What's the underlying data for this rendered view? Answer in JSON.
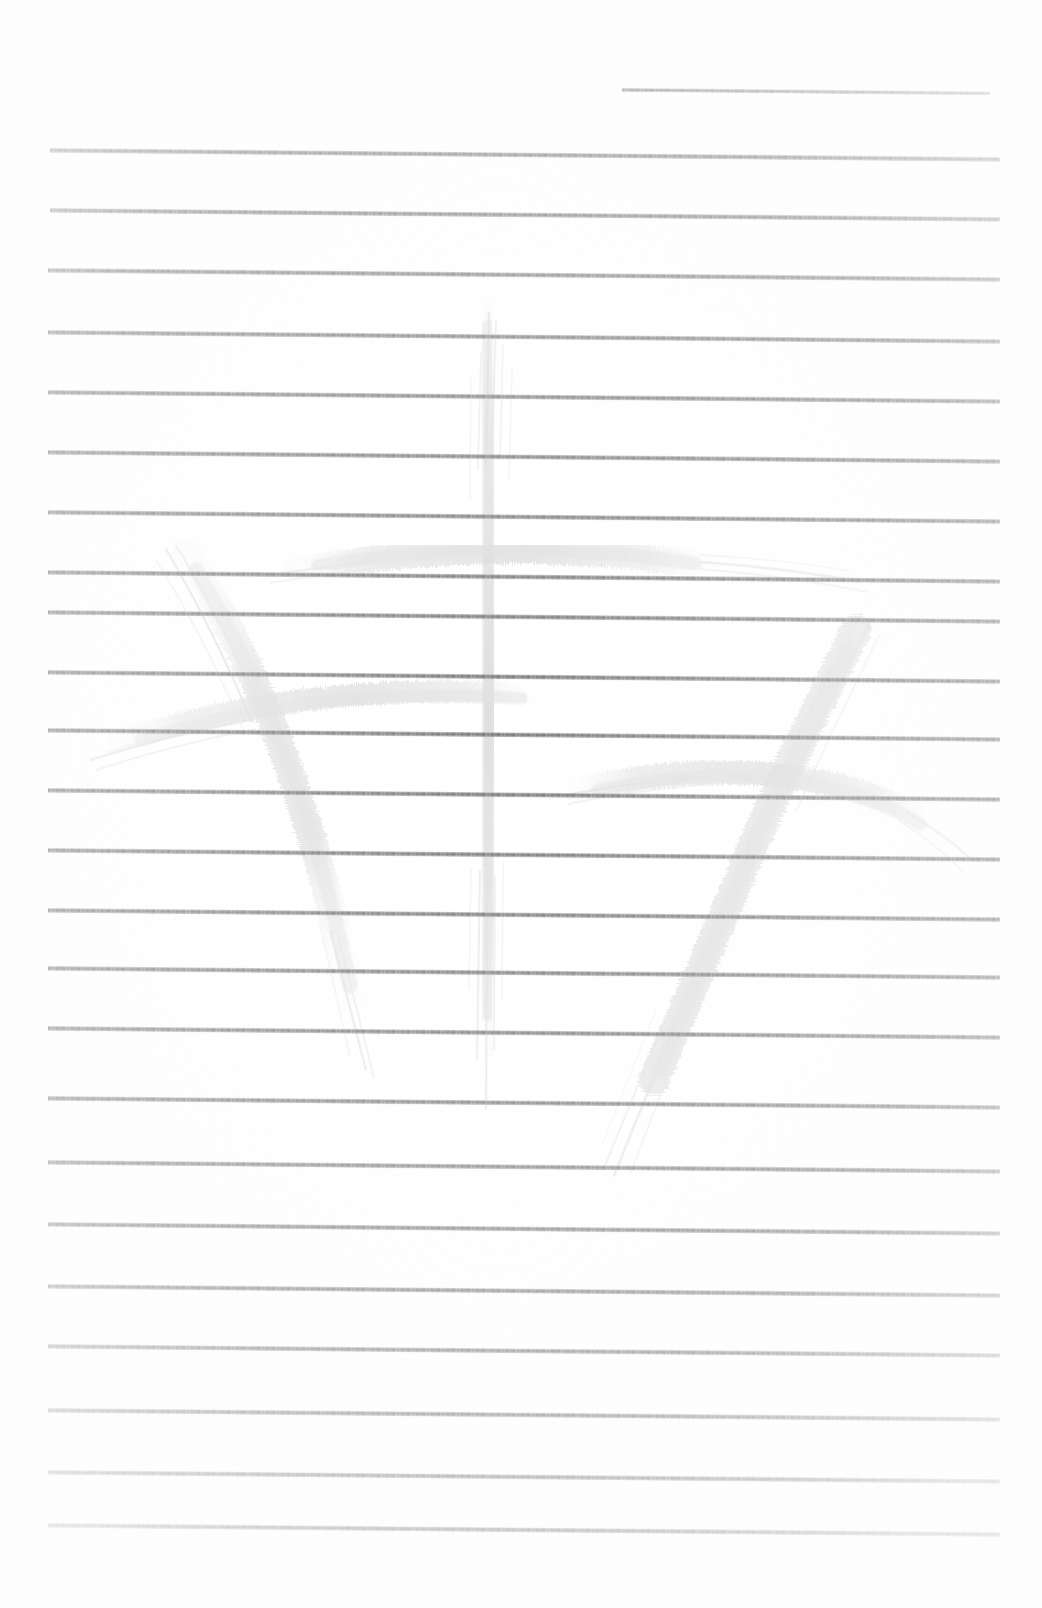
{
  "document": {
    "kind": "scanned-lined-paper",
    "title": "Lined notebook page",
    "page_width": 1042,
    "page_height": 1608,
    "background_color": "#ffffff",
    "rule_color": "#6e6e72",
    "rule_thickness": 5,
    "rule_count": 24,
    "rule_left_x": 50,
    "rule_right_x": 1000,
    "rule_slope_deg": 0.55
  },
  "rules": [
    {
      "index": 1,
      "y": 88,
      "x_start": 622,
      "x_end": 990,
      "thickness": 4,
      "opacity": 0.88,
      "note": "short top rule, right aligned"
    },
    {
      "index": 2,
      "y": 148,
      "x_start": 50,
      "x_end": 1000,
      "thickness": 5,
      "opacity": 0.95
    },
    {
      "index": 3,
      "y": 208,
      "x_start": 50,
      "x_end": 1000,
      "thickness": 5,
      "opacity": 0.95
    },
    {
      "index": 4,
      "y": 268,
      "x_start": 48,
      "x_end": 1000,
      "thickness": 5,
      "opacity": 0.93
    },
    {
      "index": 5,
      "y": 330,
      "x_start": 48,
      "x_end": 1000,
      "thickness": 5,
      "opacity": 0.95
    },
    {
      "index": 6,
      "y": 390,
      "x_start": 48,
      "x_end": 1000,
      "thickness": 5,
      "opacity": 0.94
    },
    {
      "index": 7,
      "y": 450,
      "x_start": 48,
      "x_end": 1000,
      "thickness": 5,
      "opacity": 0.94
    },
    {
      "index": 8,
      "y": 510,
      "x_start": 48,
      "x_end": 1000,
      "thickness": 5,
      "opacity": 0.93
    },
    {
      "index": 9,
      "y": 570,
      "x_start": 48,
      "x_end": 1000,
      "thickness": 5,
      "opacity": 0.94
    },
    {
      "index": 10,
      "y": 610,
      "x_start": 48,
      "x_end": 1000,
      "thickness": 5,
      "opacity": 0.93
    },
    {
      "index": 11,
      "y": 670,
      "x_start": 48,
      "x_end": 1000,
      "thickness": 5,
      "opacity": 0.94
    },
    {
      "index": 12,
      "y": 728,
      "x_start": 48,
      "x_end": 1000,
      "thickness": 5,
      "opacity": 0.94
    },
    {
      "index": 13,
      "y": 788,
      "x_start": 48,
      "x_end": 1000,
      "thickness": 5,
      "opacity": 0.93
    },
    {
      "index": 14,
      "y": 848,
      "x_start": 48,
      "x_end": 1000,
      "thickness": 5,
      "opacity": 0.94
    },
    {
      "index": 15,
      "y": 908,
      "x_start": 48,
      "x_end": 1000,
      "thickness": 5,
      "opacity": 0.94
    },
    {
      "index": 16,
      "y": 966,
      "x_start": 48,
      "x_end": 1000,
      "thickness": 5,
      "opacity": 0.93
    },
    {
      "index": 17,
      "y": 1026,
      "x_start": 48,
      "x_end": 1000,
      "thickness": 5,
      "opacity": 0.94
    },
    {
      "index": 18,
      "y": 1096,
      "x_start": 48,
      "x_end": 1000,
      "thickness": 5,
      "opacity": 0.94
    },
    {
      "index": 19,
      "y": 1160,
      "x_start": 48,
      "x_end": 1000,
      "thickness": 5,
      "opacity": 0.93
    },
    {
      "index": 20,
      "y": 1222,
      "x_start": 48,
      "x_end": 1000,
      "thickness": 5,
      "opacity": 0.94
    },
    {
      "index": 21,
      "y": 1284,
      "x_start": 48,
      "x_end": 1000,
      "thickness": 5,
      "opacity": 0.94
    },
    {
      "index": 22,
      "y": 1344,
      "x_start": 48,
      "x_end": 1000,
      "thickness": 5,
      "opacity": 0.93
    },
    {
      "index": 23,
      "y": 1408,
      "x_start": 48,
      "x_end": 1000,
      "thickness": 5,
      "opacity": 0.94
    },
    {
      "index": 24,
      "y": 1470,
      "x_start": 48,
      "x_end": 1000,
      "thickness": 5,
      "opacity": 0.94
    },
    {
      "index": 25,
      "y": 1523,
      "x_start": 48,
      "x_end": 1000,
      "thickness": 5,
      "opacity": 0.94
    }
  ],
  "watermark": {
    "description": "faint pale-gray calligraphic brush mark, dry-brush texture",
    "color": "#dcdcdc",
    "opacity": 0.85,
    "bounds": {
      "x": 90,
      "y": 305,
      "width": 840,
      "height": 890
    },
    "strokes": [
      {
        "name": "center-vertical-stroke",
        "role": "main downstroke"
      },
      {
        "name": "center-horizontal-crossbar",
        "role": "upper crossbar"
      },
      {
        "name": "left-curved-downstroke",
        "role": "left leg, hooked"
      },
      {
        "name": "left-horizontal-stroke",
        "role": "left crossbar sweep"
      },
      {
        "name": "right-curved-downstroke",
        "role": "right leg, hooked"
      },
      {
        "name": "right-horizontal-stroke",
        "role": "right crossbar sweep"
      }
    ]
  }
}
